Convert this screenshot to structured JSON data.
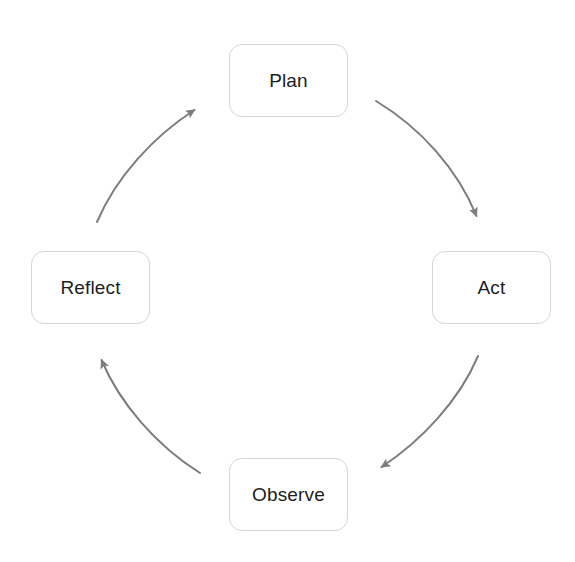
{
  "diagram": {
    "type": "cycle-diagram",
    "direction": "clockwise",
    "colors": {
      "background": "#ffffff",
      "node_fill": "#ffffff",
      "node_border": "#d6d6d6",
      "label_text": "#1d1d1f",
      "arrow_stroke": "#7d7d7d"
    },
    "nodes": [
      {
        "id": "plan",
        "label": "Plan",
        "position": "top"
      },
      {
        "id": "act",
        "label": "Act",
        "position": "right"
      },
      {
        "id": "observe",
        "label": "Observe",
        "position": "bottom"
      },
      {
        "id": "reflect",
        "label": "Reflect",
        "position": "left"
      }
    ],
    "arrows": [
      {
        "id": "plan-to-act",
        "from": "Plan",
        "to": "Act",
        "shape": "curved",
        "direction": "down-right"
      },
      {
        "id": "act-to-observe",
        "from": "Act",
        "to": "Observe",
        "shape": "curved",
        "direction": "down-left"
      },
      {
        "id": "observe-to-reflect",
        "from": "Observe",
        "to": "Reflect",
        "shape": "curved",
        "direction": "up-left"
      },
      {
        "id": "reflect-to-plan",
        "from": "Reflect",
        "to": "Plan",
        "shape": "curved",
        "direction": "up-right"
      }
    ]
  }
}
